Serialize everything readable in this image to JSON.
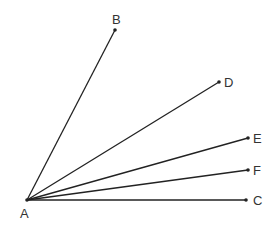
{
  "diagram": {
    "title": "",
    "line_color": "#222222",
    "label_color": "#333333",
    "vertex": {
      "id": "A",
      "x": 27,
      "y": 200,
      "label": "A",
      "label_x": 20,
      "label_y": 218
    },
    "points": [
      {
        "id": "B",
        "x": 115,
        "y": 30,
        "label": "B",
        "label_x": 112,
        "label_y": 24
      },
      {
        "id": "D",
        "x": 219,
        "y": 82,
        "label": "D",
        "label_x": 224,
        "label_y": 87
      },
      {
        "id": "E",
        "x": 248,
        "y": 138,
        "label": "E",
        "label_x": 253,
        "label_y": 143
      },
      {
        "id": "F",
        "x": 248,
        "y": 170,
        "label": "F",
        "label_x": 253,
        "label_y": 175
      },
      {
        "id": "C",
        "x": 246,
        "y": 200,
        "label": "C",
        "label_x": 253,
        "label_y": 205
      }
    ],
    "segments": [
      "AB",
      "AD",
      "AE",
      "AF",
      "AC"
    ]
  }
}
